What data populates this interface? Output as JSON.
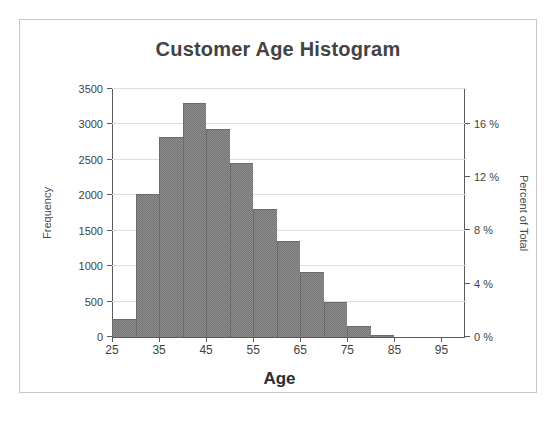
{
  "chart": {
    "title": "Customer Age Histogram",
    "accent_color": "#757575",
    "grid_color": "#dedede",
    "axis_color": "#5a5a5a"
  },
  "axis_titles": {
    "x": "Age",
    "y_left": "Frequency",
    "y_right": "Percent of Total"
  },
  "chart_data": {
    "type": "bar",
    "title": "Customer Age Histogram",
    "xlabel": "Age",
    "ylabel": "Frequency",
    "ylabel_secondary": "Percent of Total",
    "grid": true,
    "legend": "none",
    "bin_width": 5,
    "xlim": [
      25,
      100
    ],
    "ylim": [
      0,
      3500
    ],
    "ylim_secondary": [
      0,
      18.6
    ],
    "xticks": [
      25,
      35,
      45,
      55,
      65,
      75,
      85,
      95
    ],
    "xtick_labels": [
      "25",
      "35",
      "45",
      "55",
      "65",
      "75",
      "85",
      "95"
    ],
    "yticks": [
      0,
      500,
      1000,
      1500,
      2000,
      2500,
      3000,
      3500
    ],
    "ytick_labels": [
      "0",
      "500",
      "1000",
      "1500",
      "2000",
      "2500",
      "3000",
      "3500"
    ],
    "yticks_secondary": [
      0,
      4,
      8,
      12,
      16
    ],
    "ytick_labels_secondary": [
      "0 %",
      "4 %",
      "8 %",
      "12 %",
      "16 %"
    ],
    "bins": [
      {
        "start": 25,
        "end": 30,
        "value": 250
      },
      {
        "start": 30,
        "end": 35,
        "value": 2020
      },
      {
        "start": 35,
        "end": 40,
        "value": 2820
      },
      {
        "start": 40,
        "end": 45,
        "value": 3300
      },
      {
        "start": 45,
        "end": 50,
        "value": 2940
      },
      {
        "start": 50,
        "end": 55,
        "value": 2450
      },
      {
        "start": 55,
        "end": 60,
        "value": 1800
      },
      {
        "start": 60,
        "end": 65,
        "value": 1350
      },
      {
        "start": 65,
        "end": 70,
        "value": 920
      },
      {
        "start": 70,
        "end": 75,
        "value": 500
      },
      {
        "start": 75,
        "end": 80,
        "value": 160
      },
      {
        "start": 80,
        "end": 85,
        "value": 30
      }
    ],
    "categories": [
      "25-30",
      "30-35",
      "35-40",
      "40-45",
      "45-50",
      "50-55",
      "55-60",
      "60-65",
      "65-70",
      "70-75",
      "75-80",
      "80-85"
    ],
    "values": [
      250,
      2020,
      2820,
      3300,
      2940,
      2450,
      1800,
      1350,
      920,
      500,
      160,
      30
    ]
  }
}
